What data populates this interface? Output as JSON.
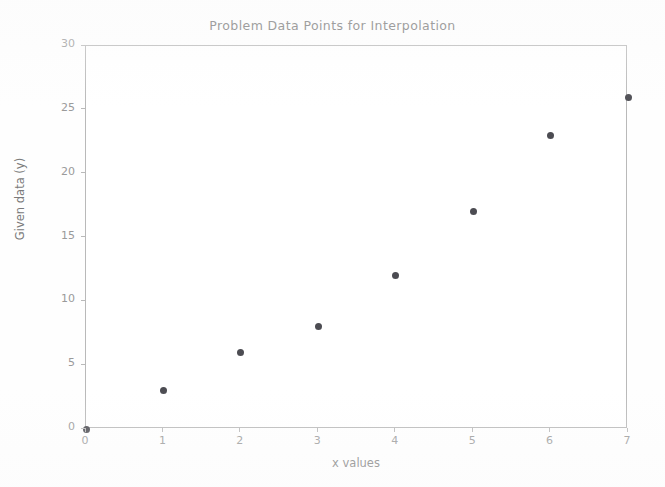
{
  "chart_data": {
    "type": "scatter",
    "title": "Problem Data Points for Interpolation",
    "xlabel": "x values",
    "ylabel": "Given data (y)",
    "x": [
      0,
      1,
      2,
      3,
      4,
      5,
      6,
      7
    ],
    "values": [
      0,
      3,
      6,
      8,
      12,
      17,
      23,
      26
    ],
    "series": [
      {
        "name": "Given data",
        "x": [
          0,
          1,
          2,
          3,
          4,
          5,
          6,
          7
        ],
        "values": [
          0,
          3,
          6,
          8,
          12,
          17,
          23,
          26
        ]
      }
    ],
    "xlim": [
      0,
      7
    ],
    "ylim": [
      0,
      30
    ],
    "xticks": [
      "0",
      "1",
      "2",
      "3",
      "4",
      "5",
      "6",
      "7"
    ],
    "yticks": [
      "0",
      "5",
      "10",
      "15",
      "20",
      "25",
      "30"
    ],
    "xtick_values": [
      0,
      1,
      2,
      3,
      4,
      5,
      6,
      7
    ],
    "ytick_values": [
      0,
      5,
      10,
      15,
      20,
      25,
      30
    ],
    "grid": false,
    "legend": false,
    "marker": "circle",
    "marker_color": "#4c4c52",
    "axis_color": "#b9b9b9",
    "title_color": "#6e6e6e",
    "label_color": "#7a7a7a",
    "tick_label_color": "#9a9a9a",
    "background_color": "#ffffff"
  }
}
